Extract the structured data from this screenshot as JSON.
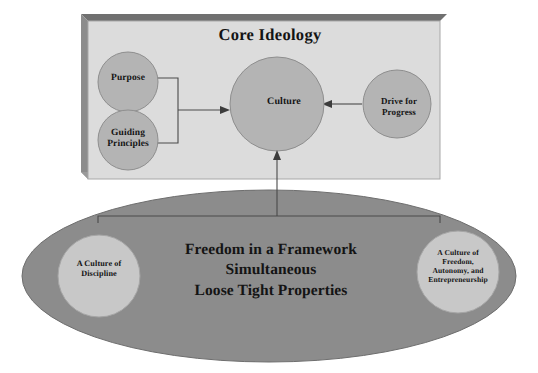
{
  "diagram": {
    "type": "concept-diagram",
    "background_color": "#ffffff",
    "core_ideology_box": {
      "title": "Core Ideology",
      "fill_color": "#dcdcdc",
      "shadow_color": "#828282",
      "border_color": "#a0a0a0",
      "nodes": [
        {
          "id": "purpose",
          "label": "Purpose",
          "shape": "circle",
          "fill_color": "#b4b4b4"
        },
        {
          "id": "guiding-principles",
          "label": "Guiding\nPrinciples",
          "shape": "circle",
          "fill_color": "#b4b4b4"
        },
        {
          "id": "culture",
          "label": "Culture",
          "shape": "circle",
          "fill_color": "#b4b4b4"
        },
        {
          "id": "drive-for-progress",
          "label": "Drive for\nProgress",
          "shape": "circle",
          "fill_color": "#b4b4b4"
        }
      ],
      "connectors": [
        {
          "from": "purpose+guiding-principles",
          "to": "culture",
          "style": "bracket-arrow",
          "direction": "right"
        },
        {
          "from": "drive-for-progress",
          "to": "culture",
          "style": "arrow",
          "direction": "left"
        }
      ]
    },
    "ellipse": {
      "fill_color": "#8c8c8c",
      "border_color": "#6e6e6e",
      "headline": "Freedom in a Framework\nSimultaneous\nLoose Tight Properties",
      "nodes": [
        {
          "id": "culture-of-discipline",
          "label": "A Culture of\nDiscipline",
          "shape": "circle",
          "fill_color": "#c8c8c8"
        },
        {
          "id": "culture-of-freedom",
          "label": "A Culture of\nFreedom,\nAutonomy, and\nEntrepreneurship",
          "shape": "circle",
          "fill_color": "#c8c8c8"
        }
      ],
      "connector": {
        "from": "ellipse-nodes",
        "to": "culture",
        "style": "bracket-arrow",
        "direction": "up"
      }
    }
  }
}
